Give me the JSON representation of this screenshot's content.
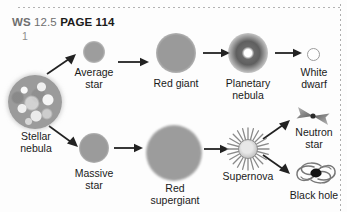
{
  "worksheet": {
    "ws_prefix": "WS",
    "ws_number": "12.5",
    "page_label": "PAGE 114",
    "question_number": "1"
  },
  "colors": {
    "background": "#fdfdfd",
    "ink": "#1a1a1a",
    "header_gray": "#6f6f6f",
    "header_black": "#1b1b1b",
    "body_gray": "#9b9b9b",
    "dark_nebula": "#5f5f5f",
    "dotted_rule": "#9a9a9a"
  },
  "diagram": {
    "stages": [
      {
        "id": "stellar-nebula",
        "label": "Stellar\nnebula",
        "icon": "nebula-icon",
        "row": "start"
      },
      {
        "id": "average-star",
        "label": "Average\nstar",
        "icon": "star-icon",
        "row": "top"
      },
      {
        "id": "red-giant",
        "label": "Red giant",
        "icon": "red-giant-icon",
        "row": "top"
      },
      {
        "id": "planetary-nebula",
        "label": "Planetary\nnebula",
        "icon": "planetary-nebula-icon",
        "row": "top"
      },
      {
        "id": "white-dwarf",
        "label": "White\ndwarf",
        "icon": "white-dwarf-icon",
        "row": "top"
      },
      {
        "id": "massive-star",
        "label": "Massive\nstar",
        "icon": "star-icon",
        "row": "bottom"
      },
      {
        "id": "red-supergiant",
        "label": "Red\nsupergiant",
        "icon": "red-supergiant-icon",
        "row": "bottom"
      },
      {
        "id": "supernova",
        "label": "Supernova",
        "icon": "supernova-icon",
        "row": "bottom"
      },
      {
        "id": "neutron-star",
        "label": "Neutron\nstar",
        "icon": "neutron-star-icon",
        "row": "branch-up"
      },
      {
        "id": "black-hole",
        "label": "Black hole",
        "icon": "black-hole-icon",
        "row": "branch-down"
      }
    ],
    "arrows": [
      {
        "from": "stellar-nebula",
        "to": "average-star",
        "direction": "up-right"
      },
      {
        "from": "stellar-nebula",
        "to": "massive-star",
        "direction": "down-right"
      },
      {
        "from": "average-star",
        "to": "red-giant",
        "direction": "right"
      },
      {
        "from": "red-giant",
        "to": "planetary-nebula",
        "direction": "right"
      },
      {
        "from": "planetary-nebula",
        "to": "white-dwarf",
        "direction": "right"
      },
      {
        "from": "massive-star",
        "to": "red-supergiant",
        "direction": "right"
      },
      {
        "from": "red-supergiant",
        "to": "supernova",
        "direction": "right"
      },
      {
        "from": "supernova",
        "to": "neutron-star",
        "direction": "up-right"
      },
      {
        "from": "supernova",
        "to": "black-hole",
        "direction": "down-right"
      }
    ]
  }
}
